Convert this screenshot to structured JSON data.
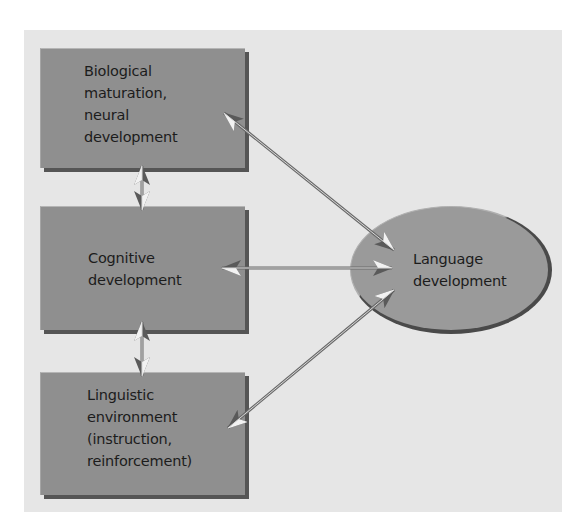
{
  "diagram": {
    "nodes": [
      {
        "id": "bio",
        "lines": [
          "Biological",
          "maturation,",
          "neural",
          "development"
        ]
      },
      {
        "id": "cog",
        "lines": [
          "Cognitive",
          "development"
        ]
      },
      {
        "id": "ling",
        "lines": [
          "Linguistic",
          "environment",
          "(instruction,",
          "reinforcement)"
        ]
      },
      {
        "id": "lang",
        "lines": [
          "Language",
          "development"
        ]
      }
    ],
    "edges": [
      {
        "from": "bio",
        "to": "cog",
        "type": "bidirectional"
      },
      {
        "from": "cog",
        "to": "ling",
        "type": "bidirectional"
      },
      {
        "from": "bio",
        "to": "lang",
        "type": "bidirectional"
      },
      {
        "from": "cog",
        "to": "lang",
        "type": "bidirectional"
      },
      {
        "from": "ling",
        "to": "lang",
        "type": "bidirectional"
      }
    ],
    "colors": {
      "panel": "#e6e6e6",
      "box_fill": "#8f8f8f",
      "box_shadow": "#555555",
      "ellipse_fill": "#9a9a9a",
      "text": "#1c1c1c"
    }
  }
}
